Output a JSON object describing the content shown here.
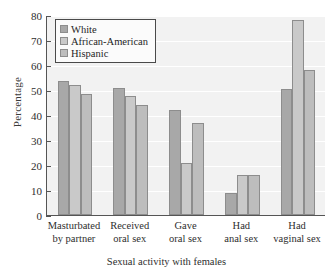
{
  "chart_data": {
    "type": "bar",
    "title": "",
    "xlabel": "Sexual activity with females",
    "ylabel": "Percentage",
    "ylim": [
      0,
      80
    ],
    "ytick_step": 10,
    "yticks": [
      0,
      10,
      20,
      30,
      40,
      50,
      60,
      70,
      80
    ],
    "grid": true,
    "legend_position": "upper-left",
    "categories": [
      "Masturbated by partner",
      "Received oral sex",
      "Gave oral sex",
      "Had anal sex",
      "Had vaginal sex"
    ],
    "category_lines": [
      [
        "Masturbated",
        "by partner"
      ],
      [
        "Received",
        "oral sex"
      ],
      [
        "Gave",
        "oral sex"
      ],
      [
        "Had",
        "anal sex"
      ],
      [
        "Had",
        "vaginal sex"
      ]
    ],
    "series": [
      {
        "name": "White",
        "color": "#a8a8a8",
        "values": [
          53.5,
          51.0,
          42.0,
          9.0,
          50.5
        ]
      },
      {
        "name": "African-American",
        "color": "#c9c9c9",
        "values": [
          52.0,
          47.5,
          21.0,
          16.0,
          78.0
        ]
      },
      {
        "name": "Hispanic",
        "color": "#bdbdbd",
        "values": [
          48.5,
          44.0,
          37.0,
          16.0,
          58.0
        ]
      }
    ]
  }
}
